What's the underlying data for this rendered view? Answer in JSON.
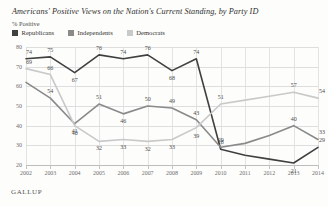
{
  "header": {
    "title": "Americans' Positive Views on the Nation's Current Standing, by Party ID",
    "subtitle": "% Positive"
  },
  "source": {
    "label": "GALLUP"
  },
  "colors": {
    "republicans": "#404040",
    "independents": "#8a8a8a",
    "democrats": "#c9c9c9",
    "grid": "#dedede",
    "axis": "#bdbdbd",
    "text": "#4b4b4b"
  },
  "legend": {
    "position": "top-left",
    "items": [
      {
        "label": "Republicans",
        "color": "#404040",
        "icon": "square-swatch"
      },
      {
        "label": "Independents",
        "color": "#8a8a8a",
        "icon": "square-swatch"
      },
      {
        "label": "Democrats",
        "color": "#c9c9c9",
        "icon": "square-swatch"
      }
    ]
  },
  "chart_data": {
    "type": "line",
    "title": "Americans' Positive Views on the Nation's Current Standing, by Party ID",
    "subtitle": "% Positive",
    "xlabel": "",
    "ylabel": "% Positive",
    "ylim": [
      20,
      80
    ],
    "yticks": [
      20,
      30,
      40,
      50,
      60,
      70,
      80
    ],
    "grid": true,
    "legend_position": "top-left",
    "categories": [
      "2002",
      "2003",
      "2004",
      "2005",
      "2006",
      "2007",
      "2008",
      "2009",
      "2010",
      "2011",
      "2012",
      "2013",
      "2014"
    ],
    "series": [
      {
        "name": "Republicans",
        "color": "#404040",
        "values": [
          74,
          75,
          67,
          76,
          74,
          76,
          68,
          74,
          28,
          25,
          23,
          21,
          29
        ],
        "labels": [
          "74",
          "75",
          "67",
          "76",
          "74",
          "76",
          "68",
          "74",
          "28",
          "",
          "",
          "21",
          "29"
        ]
      },
      {
        "name": "Independents",
        "color": "#8a8a8a",
        "values": [
          62,
          54,
          41,
          51,
          46,
          50,
          49,
          43,
          29,
          31,
          35,
          40,
          33
        ],
        "labels": [
          "",
          "54",
          "41",
          "51",
          "46",
          "50",
          "49",
          "43",
          "29",
          "",
          "",
          "40",
          "33"
        ]
      },
      {
        "name": "Democrats",
        "color": "#c9c9c9",
        "values": [
          69,
          66,
          40,
          32,
          33,
          32,
          33,
          39,
          51,
          53,
          55,
          57,
          54
        ],
        "labels": [
          "69",
          "66",
          "40",
          "32",
          "33",
          "32",
          "33",
          "39",
          "51",
          "",
          "",
          "57",
          "54"
        ]
      }
    ]
  }
}
